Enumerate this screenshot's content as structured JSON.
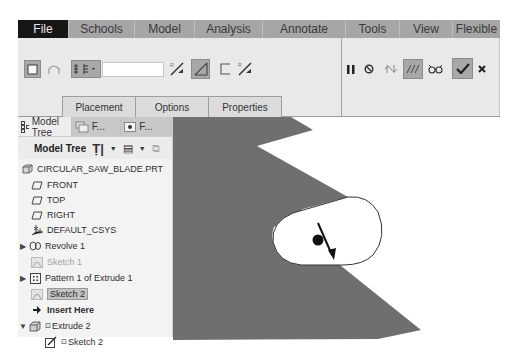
{
  "menubar": {
    "items": [
      {
        "label": "File",
        "active": true
      },
      {
        "label": "Schools"
      },
      {
        "label": "Model"
      },
      {
        "label": "Analysis"
      },
      {
        "label": "Annotate"
      },
      {
        "label": "Tools"
      },
      {
        "label": "View"
      },
      {
        "label": "Flexible"
      }
    ]
  },
  "ribbon": {
    "depth_value": "",
    "icons": {
      "solid": "solid-icon",
      "surface": "surface-icon",
      "depth_options": "depth-options-icon",
      "flip_direction": "flip-direction-icon",
      "remove_material": "remove-material-icon",
      "thicken": "thicken-sketch-icon",
      "flip_thicken": "flip-thicken-icon",
      "pause": "pause-icon",
      "no_preview": "no-preview-icon",
      "attached_preview": "attached-preview-icon",
      "detached_preview": "detached-preview-icon",
      "verify": "verify-icon",
      "ok": "checkmark-icon",
      "cancel": "close-icon"
    },
    "sub_tabs": [
      "Placement",
      "Options",
      "Properties"
    ]
  },
  "navigator": {
    "tabs": [
      {
        "label": "Model Tree",
        "active": true
      },
      {
        "label": "F..."
      },
      {
        "label": "F..."
      }
    ],
    "toolbar_title": "Model Tree"
  },
  "tree": {
    "items": [
      {
        "label": "CIRCULAR_SAW_BLADE.PRT",
        "icon": "part-icon",
        "expander": "",
        "indent": 0
      },
      {
        "label": "FRONT",
        "icon": "datum-plane-icon",
        "expander": "",
        "indent": 1
      },
      {
        "label": "TOP",
        "icon": "datum-plane-icon",
        "expander": "",
        "indent": 1
      },
      {
        "label": "RIGHT",
        "icon": "datum-plane-icon",
        "expander": "",
        "indent": 1
      },
      {
        "label": "DEFAULT_CSYS",
        "icon": "csys-icon",
        "expander": "",
        "indent": 1
      },
      {
        "label": "Revolve 1",
        "icon": "revolve-icon",
        "expander": "▶",
        "indent": 0
      },
      {
        "label": "Sketch 1",
        "icon": "sketch-icon",
        "expander": "",
        "indent": 1,
        "dim": true
      },
      {
        "label": "Pattern 1 of Extrude 1",
        "icon": "pattern-icon",
        "expander": "▶",
        "indent": 0
      },
      {
        "label": "Sketch 2",
        "icon": "sketch-icon",
        "expander": "",
        "indent": 1,
        "selected": true
      },
      {
        "label": "Insert Here",
        "icon": "insert-arrow-icon",
        "expander": "",
        "indent": 1,
        "bold": true
      },
      {
        "label": "Extrude 2",
        "icon": "extrude-icon",
        "expander": "▼",
        "indent": 0,
        "prefix": "⊡"
      },
      {
        "label": "Sketch 2",
        "icon": "sketch-edit-icon",
        "expander": "",
        "indent": 2,
        "prefix": "⊡"
      }
    ]
  },
  "colors": {
    "menubar_bg": "#a6a6a6",
    "file_tab_bg": "#161616",
    "ribbon_bg": "#e9e9e9",
    "model_fill": "#6f6f6f",
    "selection_bg": "#c2c2c2"
  }
}
